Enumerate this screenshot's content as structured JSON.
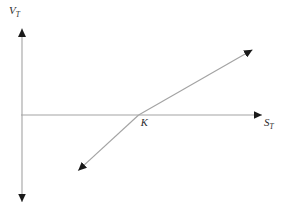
{
  "figure": {
    "background_color": "#ffffff",
    "line_color": "#a3a3a3",
    "arrow_color": "#1a1a1a",
    "text_color": "#2b2b2b"
  },
  "labels": {
    "y_axis_main": "V",
    "y_axis_sub": "T",
    "x_axis_main": "S",
    "x_axis_sub": "T",
    "strike_label": "K"
  },
  "chart_data": {
    "type": "line",
    "title": "",
    "subtitle": "",
    "xlabel": "S_T",
    "ylabel": "V_T",
    "grid": false,
    "legend": null,
    "axis_style": "arrows-both-ends",
    "xlim": [
      0,
      1
    ],
    "ylim": [
      -1,
      1
    ],
    "annotations": [
      {
        "text": "K",
        "x": 0.486,
        "y": 0.0,
        "description": "strike price marked at the x-intercept of the payoff line"
      }
    ],
    "series": [
      {
        "name": "payoff",
        "description": "straight payoff line with positive unit slope crossing the horizontal axis at K",
        "slope": 1,
        "x_intercept": 0.486,
        "y_intercept": -0.486,
        "x": [
          0.24,
          1.0
        ],
        "y": [
          -0.62,
          0.86
        ],
        "arrow_start": true,
        "arrow_end": true
      }
    ],
    "axes": {
      "x_axis": {
        "from_x": 0.0,
        "to_x": 1.0,
        "at_y": 0.0,
        "arrow_end": true,
        "arrow_start": false
      },
      "y_axis": {
        "from_y": -1.0,
        "to_y": 1.0,
        "at_x": 0.0,
        "arrow_end": true,
        "arrow_start": true
      }
    }
  }
}
